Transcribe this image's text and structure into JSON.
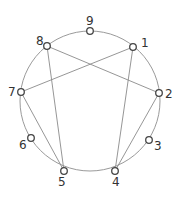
{
  "diagram": {
    "circle": {
      "cx": 90,
      "cy": 101,
      "r": 70,
      "stroke": "#9a9a9a"
    },
    "line_color": "#8a8a8a",
    "node_stroke": "#444444",
    "nodes": [
      {
        "label": "1",
        "x": 133,
        "y": 47,
        "lx": 141,
        "ly": 47
      },
      {
        "label": "2",
        "x": 159,
        "y": 93,
        "lx": 165,
        "ly": 98
      },
      {
        "label": "3",
        "x": 149,
        "y": 140,
        "lx": 154,
        "ly": 150
      },
      {
        "label": "4",
        "x": 115,
        "y": 171,
        "lx": 112,
        "ly": 186
      },
      {
        "label": "5",
        "x": 64,
        "y": 171,
        "lx": 58,
        "ly": 186
      },
      {
        "label": "6",
        "x": 31,
        "y": 138,
        "lx": 19,
        "ly": 149
      },
      {
        "label": "7",
        "x": 21,
        "y": 92,
        "lx": 8,
        "ly": 96
      },
      {
        "label": "8",
        "x": 47,
        "y": 46,
        "lx": 36,
        "ly": 45
      },
      {
        "label": "9",
        "x": 90,
        "y": 31,
        "lx": 86,
        "ly": 25
      }
    ],
    "edges": [
      {
        "from": "1",
        "to": "7"
      },
      {
        "from": "8",
        "to": "2"
      },
      {
        "from": "8",
        "to": "5"
      },
      {
        "from": "7",
        "to": "5"
      },
      {
        "from": "1",
        "to": "4"
      },
      {
        "from": "2",
        "to": "4"
      }
    ]
  }
}
